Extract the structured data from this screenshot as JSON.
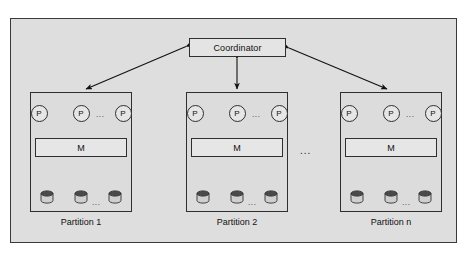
{
  "figure": {
    "background_color": "#dedede",
    "frame_border_color": "#3a3a3a",
    "coordinator": {
      "label": "Coordinator",
      "fill": "#e4e4e4"
    },
    "ellipsis_between_partitions": "...",
    "partitions": [
      {
        "id": "partition-1",
        "label": "Partition 1",
        "x": 30,
        "processors": [
          {
            "label": "P"
          },
          {
            "label": "P"
          },
          {
            "label": "P"
          }
        ],
        "processor_ellipsis": "...",
        "memory": {
          "label": "M"
        },
        "disks": [
          {
            "name": "disk-1"
          },
          {
            "name": "disk-2"
          },
          {
            "name": "disk-3"
          }
        ],
        "disk_ellipsis": "..."
      },
      {
        "id": "partition-2",
        "label": "Partition 2",
        "x": 186,
        "processors": [
          {
            "label": "P"
          },
          {
            "label": "P"
          },
          {
            "label": "P"
          }
        ],
        "processor_ellipsis": "...",
        "memory": {
          "label": "M"
        },
        "disks": [
          {
            "name": "disk-1"
          },
          {
            "name": "disk-2"
          },
          {
            "name": "disk-3"
          }
        ],
        "disk_ellipsis": "..."
      },
      {
        "id": "partition-n",
        "label": "Partition n",
        "x": 340,
        "processors": [
          {
            "label": "P"
          },
          {
            "label": "P"
          },
          {
            "label": "P"
          }
        ],
        "processor_ellipsis": "...",
        "memory": {
          "label": "M"
        },
        "disks": [
          {
            "name": "disk-1"
          },
          {
            "name": "disk-2"
          },
          {
            "name": "disk-3"
          }
        ],
        "disk_ellipsis": "..."
      }
    ],
    "connectors": [
      {
        "name": "coordinator-to-partition-1",
        "style": "double-headed-arrow"
      },
      {
        "name": "coordinator-to-partition-2",
        "style": "double-headed-arrow"
      },
      {
        "name": "coordinator-to-partition-n",
        "style": "double-headed-arrow"
      }
    ]
  }
}
